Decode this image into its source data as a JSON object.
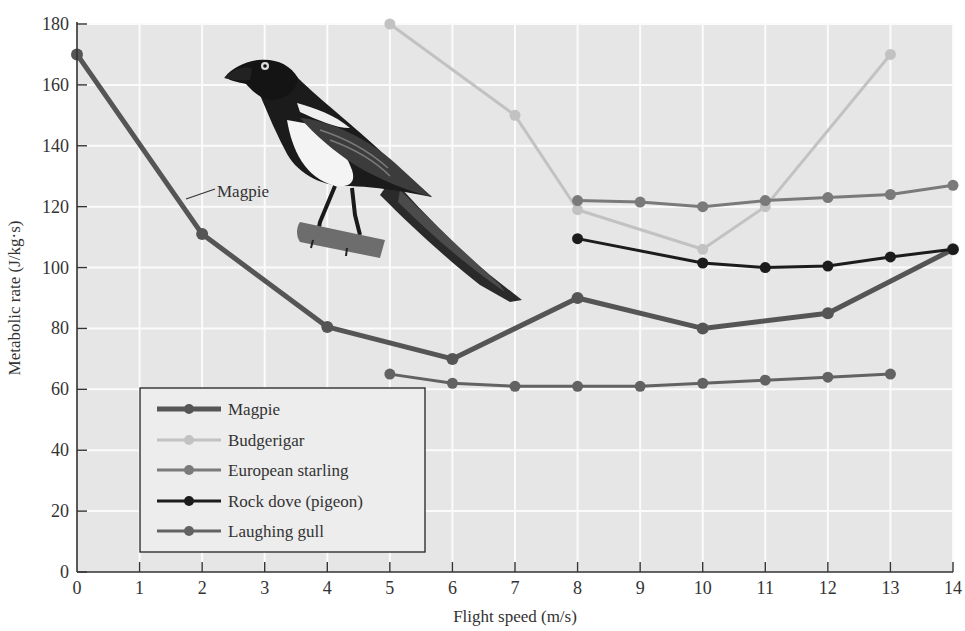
{
  "chart_data": {
    "type": "line",
    "title": "",
    "xlabel": "Flight speed (m/s)",
    "ylabel": "Metabolic rate (J/kg·s)",
    "xlim": [
      0,
      14
    ],
    "ylim": [
      0,
      180
    ],
    "xticks": [
      0,
      1,
      2,
      3,
      4,
      5,
      6,
      7,
      8,
      9,
      10,
      11,
      12,
      13,
      14
    ],
    "yticks": [
      0,
      20,
      40,
      60,
      80,
      100,
      120,
      140,
      160,
      180
    ],
    "grid": true,
    "legend_position": "lower-left",
    "series": [
      {
        "name": "Magpie",
        "color": "#555555",
        "width": 5,
        "x": [
          0,
          2,
          4,
          6,
          8,
          10,
          12,
          14
        ],
        "y": [
          170,
          111,
          80.5,
          70,
          90,
          80,
          85,
          106
        ]
      },
      {
        "name": "Budgerigar",
        "color": "#c2c2c2",
        "width": 3,
        "x": [
          5,
          7,
          8,
          10,
          11,
          13
        ],
        "y": [
          180,
          150,
          119,
          106,
          120,
          170
        ]
      },
      {
        "name": "European starling",
        "color": "#7a7a7a",
        "width": 3,
        "x": [
          8,
          9,
          10,
          11,
          12,
          13,
          14
        ],
        "y": [
          122,
          121.5,
          120,
          122,
          123,
          124,
          127
        ]
      },
      {
        "name": "Rock dove (pigeon)",
        "color": "#1c1c1c",
        "width": 3,
        "x": [
          8,
          10,
          11,
          12,
          13,
          14
        ],
        "y": [
          109.5,
          101.5,
          100,
          100.5,
          103.5,
          106
        ]
      },
      {
        "name": "Laughing gull",
        "color": "#626262",
        "width": 3,
        "x": [
          5,
          6,
          7,
          8,
          9,
          10,
          11,
          12,
          13
        ],
        "y": [
          65,
          62,
          61,
          61,
          61,
          62,
          63,
          64,
          65
        ]
      }
    ],
    "annotations": [
      {
        "text": "Magpie",
        "points_to_series": "Magpie",
        "x": 1.4,
        "y": 124
      }
    ],
    "illustration": "magpie-bird-on-branch"
  },
  "legend": {
    "items": [
      {
        "label": "Magpie"
      },
      {
        "label": "Budgerigar"
      },
      {
        "label": "European starling"
      },
      {
        "label": "Rock dove (pigeon)"
      },
      {
        "label": "Laughing gull"
      }
    ]
  },
  "labels": {
    "xlabel": "Flight speed (m/s)",
    "ylabel": "Metabolic rate (J/kg·s)",
    "magpie_annotation": "Magpie"
  },
  "style": {
    "plot_bg": "#e6e6e6",
    "grid_color": "#fbfbfb",
    "axis_color": "#333333"
  }
}
